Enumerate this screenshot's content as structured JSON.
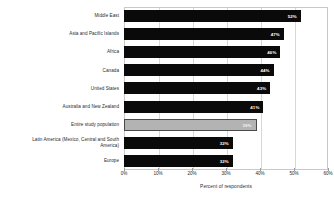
{
  "chart_data": {
    "type": "bar",
    "orientation": "horizontal",
    "title": "",
    "xlabel": "Percent of respondents",
    "ylabel": "",
    "xlim": [
      0,
      60
    ],
    "grid": true,
    "legend": false,
    "xticks": [
      "0%",
      "10%",
      "20%",
      "30%",
      "40%",
      "50%",
      "60%"
    ],
    "xtick_values": [
      0,
      10,
      20,
      30,
      40,
      50,
      60
    ],
    "categories": [
      "Middle East",
      "Asia and Pacific Islands",
      "Africa",
      "Canada",
      "United States",
      "Australia and New Zealand",
      "Entire study population",
      "Latin America (Mexico, Central and South\nAmerica)",
      "Europe"
    ],
    "values": [
      52,
      47,
      46,
      44,
      43,
      41,
      39,
      32,
      32
    ],
    "value_labels": [
      "52%",
      "47%",
      "46%",
      "44%",
      "43%",
      "41%",
      "39%",
      "32%",
      "32%"
    ],
    "highlight_index": 6,
    "colors": {
      "bar": "#0a0a0a",
      "highlight_bar": "#b3b3b3",
      "highlight_border": "#4a4a4a",
      "value_label": "#ffffff",
      "text": "#2b2b2b",
      "gridline": "#d8d8d8",
      "frame": "#c9c9c9",
      "background": "#ffffff"
    }
  }
}
